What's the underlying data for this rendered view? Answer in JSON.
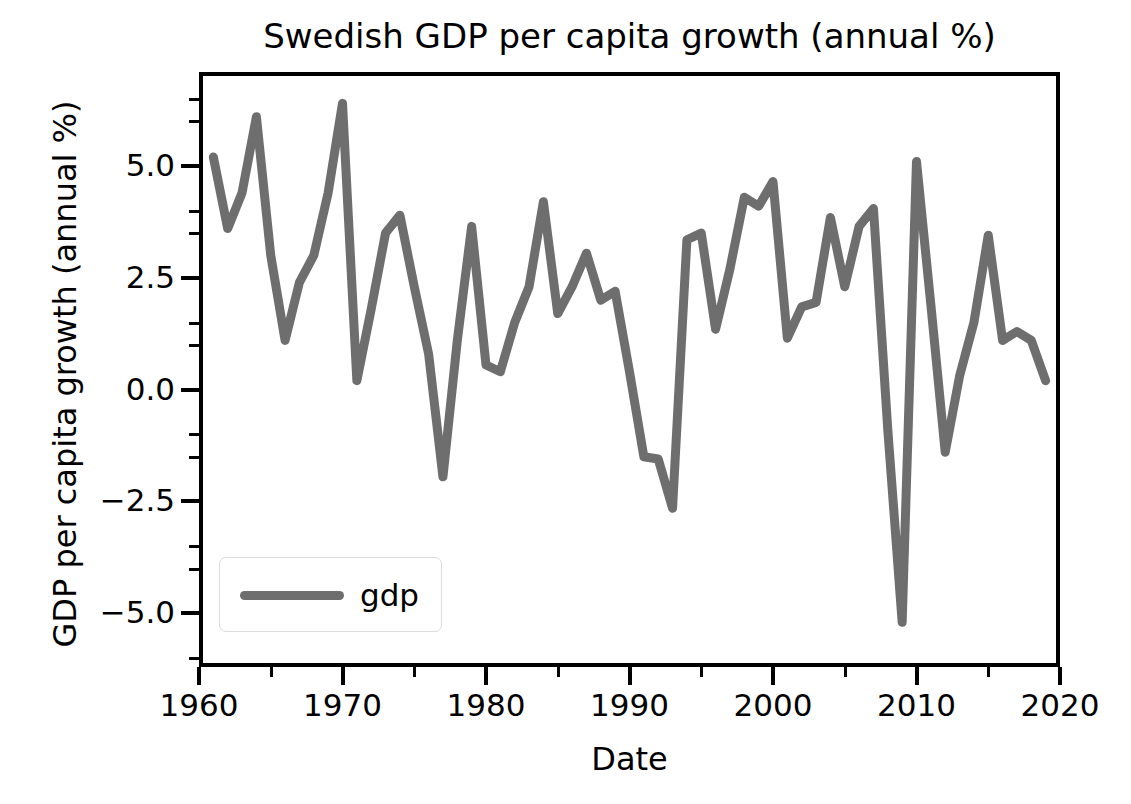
{
  "chart_data": {
    "type": "line",
    "title": "Swedish GDP per capita growth (annual %)",
    "xlabel": "Date",
    "ylabel": "GDP per capita growth (annual %)",
    "xlim": [
      1960,
      2020
    ],
    "ylim": [
      -6.2,
      7.1
    ],
    "grid": false,
    "legend_position": "lower left",
    "line_color": "#6e6e6e",
    "line_width": 9,
    "xticks": [
      1960,
      1970,
      1980,
      1990,
      2000,
      2010,
      2020
    ],
    "xtick_labels": [
      "1960",
      "1970",
      "1980",
      "1990",
      "2000",
      "2010",
      "2020"
    ],
    "xticks_minor": [
      1965,
      1975,
      1985,
      1995,
      2005,
      2015
    ],
    "yticks": [
      -5.0,
      -2.5,
      0.0,
      2.5,
      5.0
    ],
    "ytick_labels": [
      "-5.0",
      "-2.5",
      "0.0",
      "2.5",
      "5.0"
    ],
    "yticks_minor": [
      -6.0,
      -4.0,
      -3.5,
      -1.5,
      -1.0,
      1.0,
      1.5,
      3.5,
      4.0,
      6.0,
      6.5
    ],
    "series": [
      {
        "name": "gdp",
        "x": [
          1961,
          1962,
          1963,
          1964,
          1965,
          1966,
          1967,
          1968,
          1969,
          1970,
          1971,
          1972,
          1973,
          1974,
          1975,
          1976,
          1977,
          1978,
          1979,
          1980,
          1981,
          1982,
          1983,
          1984,
          1985,
          1986,
          1987,
          1988,
          1989,
          1990,
          1991,
          1992,
          1993,
          1994,
          1995,
          1996,
          1997,
          1998,
          1999,
          2000,
          2001,
          2002,
          2003,
          2004,
          2005,
          2006,
          2007,
          2008,
          2009,
          2010,
          2011,
          2012,
          2013,
          2014,
          2015,
          2016,
          2017,
          2018,
          2019
        ],
        "values": [
          5.2,
          3.6,
          4.4,
          6.1,
          3.0,
          1.1,
          2.4,
          3.0,
          4.4,
          6.4,
          0.2,
          1.8,
          3.5,
          3.9,
          2.3,
          0.8,
          -1.95,
          1.1,
          3.65,
          0.55,
          0.4,
          1.5,
          2.3,
          4.2,
          1.7,
          2.3,
          3.05,
          2.0,
          2.2,
          0.4,
          -1.5,
          -1.55,
          -2.65,
          3.35,
          3.5,
          1.35,
          2.7,
          4.3,
          4.1,
          4.65,
          1.15,
          1.85,
          1.95,
          3.85,
          2.3,
          3.65,
          4.05,
          -0.9,
          -5.2,
          5.1,
          1.9,
          -1.4,
          0.3,
          1.5,
          3.45,
          1.1,
          1.3,
          1.1,
          0.2
        ]
      }
    ]
  },
  "title": {
    "text": "Swedish GDP per capita growth (annual %)"
  },
  "axes": {
    "xlabel": "Date",
    "ylabel": "GDP per capita growth (annual %)"
  },
  "legend": {
    "entries": [
      {
        "label": "gdp",
        "color": "#6e6e6e"
      }
    ]
  }
}
